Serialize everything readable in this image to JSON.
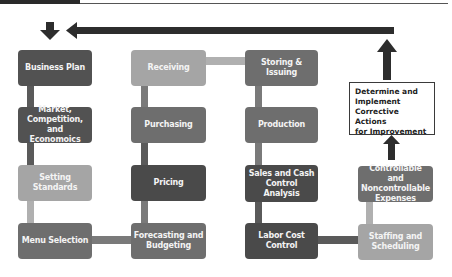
{
  "header": {
    "bar_color": "#2a2a2a",
    "line_color": "#555555"
  },
  "colors": {
    "dark": "#525252",
    "mid": "#6e6e6e",
    "light": "#a5a5a5",
    "arrow": "#2d2d2d"
  },
  "columns": [
    {
      "boxes": [
        {
          "label": "Business Plan",
          "shade": "dark"
        },
        {
          "label": "Market, Competition, and Economoics",
          "shade": "dark"
        },
        {
          "label": "Setting Standards",
          "shade": "light"
        },
        {
          "label": "Menu Selection",
          "shade": "mid"
        }
      ]
    },
    {
      "boxes": [
        {
          "label": "Receiving",
          "shade": "light"
        },
        {
          "label": "Purchasing",
          "shade": "mid"
        },
        {
          "label": "Pricing",
          "shade": "dark"
        },
        {
          "label": "Forecasting and Budgeting",
          "shade": "mid"
        }
      ]
    },
    {
      "boxes": [
        {
          "label": "Storing & Issuing",
          "shade": "mid"
        },
        {
          "label": "Production",
          "shade": "mid"
        },
        {
          "label": "Sales and Cash Control Analysis",
          "shade": "dark"
        },
        {
          "label": "Labor Cost Control",
          "shade": "dark"
        }
      ]
    },
    {
      "boxes": [
        {
          "label": "Determine and Implement Corrective Actions for Improvement",
          "shade": "outline"
        },
        {
          "label": "Controllable and Noncontrollable Expenses",
          "shade": "mid"
        },
        {
          "label": "Staffing and Scheduling",
          "shade": "light"
        }
      ]
    }
  ],
  "labels": {
    "c1b1": "Business Plan",
    "c1b2_l1": "Market,",
    "c1b2_l2": "Competition, and",
    "c1b2_l3": "Economoics",
    "c1b3": "Setting Standards",
    "c1b4": "Menu Selection",
    "c2b1": "Receiving",
    "c2b2": "Purchasing",
    "c2b3": "Pricing",
    "c2b4_l1": "Forecasting and",
    "c2b4_l2": "Budgeting",
    "c3b1": "Storing & Issuing",
    "c3b2": "Production",
    "c3b3_l1": "Sales and Cash",
    "c3b3_l2": "Control Analysis",
    "c3b4_l1": "Labor Cost",
    "c3b4_l2": "Control",
    "c4_corrective_l1": "Determine and",
    "c4_corrective_l2": "Implement",
    "c4_corrective_l3": "Corrective Actions",
    "c4_corrective_l4": "for Improvement",
    "c4b2_l1": "Controllable and",
    "c4b2_l2": "Noncontrollable",
    "c4b2_l3": "Expenses",
    "c4b3_l1": "Staffing and",
    "c4b3_l2": "Scheduling"
  }
}
